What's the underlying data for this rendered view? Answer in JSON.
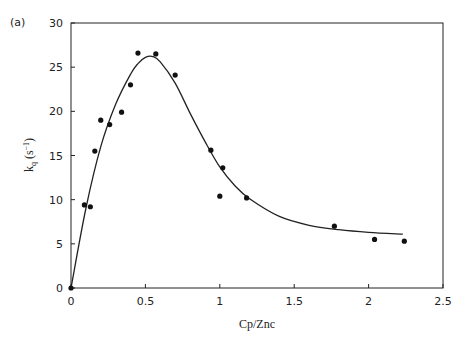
{
  "panel_label": "(a)",
  "chart_data": {
    "type": "scatter",
    "title": "",
    "xlabel": "Cp/Znc",
    "ylabel_main": "k",
    "ylabel_sub": "q",
    "ylabel_unit": "(s",
    "ylabel_exp": "−1",
    "ylabel_close": ")",
    "xlim": [
      0,
      2.5
    ],
    "ylim": [
      0,
      30
    ],
    "xticks": [
      0,
      0.5,
      1,
      1.5,
      2,
      2.5
    ],
    "xtick_labels": [
      "0",
      "0.5",
      "1",
      "1.5",
      "2",
      "2.5"
    ],
    "yticks": [
      0,
      5,
      10,
      15,
      20,
      25,
      30
    ],
    "ytick_labels": [
      "0",
      "5",
      "10",
      "15",
      "20",
      "25",
      "30"
    ],
    "grid": false,
    "series": [
      {
        "name": "measured",
        "kind": "points",
        "x": [
          0,
          0.09,
          0.13,
          0.16,
          0.2,
          0.26,
          0.34,
          0.4,
          0.45,
          0.57,
          0.7,
          0.94,
          1.0,
          1.02,
          1.18,
          1.77,
          2.04,
          2.24
        ],
        "y": [
          0,
          9.4,
          9.2,
          15.5,
          19.0,
          18.5,
          19.9,
          23.0,
          26.6,
          26.5,
          24.1,
          15.6,
          10.4,
          13.6,
          10.2,
          7.0,
          5.5,
          5.3
        ]
      },
      {
        "name": "fit",
        "kind": "line",
        "x": [
          0,
          0.1,
          0.2,
          0.3,
          0.4,
          0.45,
          0.5,
          0.55,
          0.6,
          0.7,
          0.8,
          0.9,
          1.0,
          1.1,
          1.2,
          1.4,
          1.6,
          1.8,
          2.0,
          2.23
        ],
        "y": [
          0,
          9.0,
          16.0,
          20.8,
          24.2,
          25.4,
          26.1,
          26.2,
          25.6,
          23.2,
          19.8,
          16.6,
          13.7,
          11.6,
          10.1,
          8.1,
          7.1,
          6.6,
          6.3,
          6.1
        ]
      }
    ]
  }
}
